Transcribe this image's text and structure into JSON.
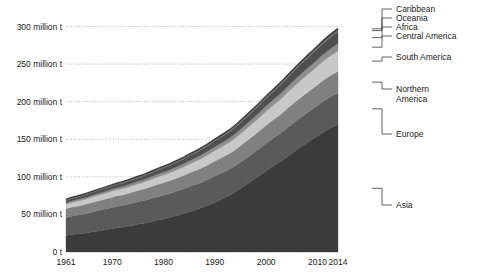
{
  "chart_data": {
    "type": "area",
    "stacked": true,
    "title": "",
    "xlabel": "",
    "ylabel": "",
    "xlim": [
      1961,
      2014
    ],
    "ylim": [
      0,
      310
    ],
    "grid": true,
    "legend_position": "right",
    "y_unit": "million t",
    "y_ticks": [
      0,
      50,
      100,
      150,
      200,
      250,
      300
    ],
    "y_tick_labels": [
      "0 t",
      "50 million t",
      "100 million t",
      "150 million t",
      "200 million t",
      "250 million t",
      "300 million t"
    ],
    "x_ticks": [
      1961,
      1970,
      1980,
      1990,
      2000,
      2010,
      2014
    ],
    "x_tick_labels": [
      "1961",
      "1970",
      "1980",
      "1990",
      "2000",
      "2010",
      "2014"
    ],
    "x": [
      1961,
      1962,
      1963,
      1964,
      1965,
      1966,
      1967,
      1968,
      1969,
      1970,
      1971,
      1972,
      1973,
      1974,
      1975,
      1976,
      1977,
      1978,
      1979,
      1980,
      1981,
      1982,
      1983,
      1984,
      1985,
      1986,
      1987,
      1988,
      1989,
      1990,
      1991,
      1992,
      1993,
      1994,
      1995,
      1996,
      1997,
      1998,
      1999,
      2000,
      2001,
      2002,
      2003,
      2004,
      2005,
      2006,
      2007,
      2008,
      2009,
      2010,
      2011,
      2012,
      2013,
      2014
    ],
    "series": [
      {
        "name": "Asia",
        "color": "#3b3b3b",
        "values": [
          22.0,
          23.0,
          23.8,
          24.6,
          25.4,
          26.5,
          27.6,
          28.7,
          29.8,
          31.0,
          32.2,
          33.0,
          34.2,
          35.4,
          36.8,
          38.0,
          39.4,
          41.0,
          42.6,
          44.0,
          45.6,
          47.4,
          49.2,
          51.2,
          53.4,
          55.6,
          57.8,
          60.4,
          63.0,
          66.0,
          69.0,
          72.4,
          76.0,
          80.0,
          84.5,
          89.0,
          93.5,
          98.0,
          103.0,
          108.0,
          112.5,
          117.0,
          121.5,
          126.5,
          131.5,
          136.5,
          141.0,
          145.5,
          150.0,
          154.5,
          159.0,
          163.0,
          166.5,
          169.5
        ]
      },
      {
        "name": "Europe",
        "color": "#5a5a5a",
        "values": [
          24.0,
          24.6,
          25.0,
          25.4,
          25.8,
          26.4,
          27.0,
          27.4,
          27.8,
          28.2,
          28.6,
          28.8,
          29.2,
          29.6,
          30.0,
          30.2,
          30.6,
          31.0,
          31.4,
          31.6,
          31.8,
          32.2,
          32.6,
          33.0,
          33.4,
          33.6,
          33.8,
          34.2,
          34.6,
          35.0,
          35.0,
          34.8,
          34.6,
          34.6,
          34.8,
          35.2,
          35.6,
          36.0,
          36.4,
          36.8,
          37.0,
          37.4,
          37.6,
          38.2,
          38.6,
          39.0,
          39.4,
          39.8,
          40.0,
          40.4,
          40.8,
          41.2,
          41.6,
          42.0
        ]
      },
      {
        "name": "Northern America",
        "color": "#808080",
        "values": [
          11.5,
          11.8,
          12.0,
          12.2,
          12.5,
          12.8,
          13.0,
          13.2,
          13.5,
          13.8,
          14.0,
          14.2,
          14.5,
          14.8,
          15.0,
          15.3,
          15.6,
          16.0,
          16.3,
          16.6,
          16.9,
          17.2,
          17.5,
          17.8,
          18.2,
          18.5,
          18.8,
          19.2,
          19.6,
          20.0,
          20.4,
          20.8,
          21.2,
          21.6,
          22.0,
          22.4,
          22.8,
          23.2,
          23.6,
          24.0,
          24.3,
          24.6,
          25.0,
          25.4,
          25.8,
          26.2,
          26.6,
          27.0,
          27.3,
          27.6,
          28.0,
          28.3,
          28.6,
          29.0
        ]
      },
      {
        "name": "South America",
        "color": "#c8c8c8",
        "values": [
          6.0,
          6.2,
          6.4,
          6.6,
          6.8,
          7.0,
          7.2,
          7.4,
          7.6,
          7.8,
          8.0,
          8.2,
          8.4,
          8.6,
          8.8,
          9.0,
          9.3,
          9.6,
          9.9,
          10.2,
          10.5,
          10.8,
          11.1,
          11.4,
          11.8,
          12.2,
          12.6,
          13.0,
          13.4,
          13.8,
          14.2,
          14.6,
          15.0,
          15.5,
          16.0,
          16.5,
          17.0,
          17.5,
          18.0,
          18.6,
          19.2,
          19.8,
          20.4,
          21.0,
          21.6,
          22.2,
          22.8,
          23.4,
          24.0,
          24.6,
          25.2,
          25.8,
          26.4,
          27.0
        ]
      },
      {
        "name": "Central America",
        "color": "#8f8f8f",
        "values": [
          2.0,
          2.1,
          2.2,
          2.3,
          2.4,
          2.5,
          2.6,
          2.7,
          2.8,
          2.9,
          3.0,
          3.1,
          3.2,
          3.3,
          3.4,
          3.5,
          3.6,
          3.7,
          3.8,
          3.9,
          4.0,
          4.1,
          4.2,
          4.3,
          4.5,
          4.6,
          4.8,
          4.9,
          5.1,
          5.2,
          5.4,
          5.5,
          5.7,
          5.9,
          6.1,
          6.3,
          6.5,
          6.7,
          6.9,
          7.1,
          7.3,
          7.5,
          7.7,
          7.9,
          8.1,
          8.3,
          8.5,
          8.7,
          8.9,
          9.1,
          9.3,
          9.5,
          9.7,
          9.9
        ]
      },
      {
        "name": "Africa",
        "color": "#4f4f4f",
        "values": [
          3.0,
          3.1,
          3.2,
          3.3,
          3.4,
          3.5,
          3.6,
          3.7,
          3.8,
          3.9,
          4.0,
          4.1,
          4.3,
          4.4,
          4.6,
          4.7,
          4.9,
          5.1,
          5.2,
          5.4,
          5.6,
          5.8,
          6.0,
          6.2,
          6.4,
          6.6,
          6.8,
          7.0,
          7.2,
          7.4,
          7.7,
          7.9,
          8.2,
          8.4,
          8.7,
          9.0,
          9.3,
          9.6,
          9.9,
          10.2,
          10.6,
          11.0,
          11.4,
          11.8,
          12.2,
          12.6,
          13.0,
          13.4,
          13.8,
          14.2,
          14.6,
          15.0,
          15.4,
          15.8
        ]
      },
      {
        "name": "Oceania",
        "color": "#6e6e6e",
        "values": [
          1.0,
          1.02,
          1.05,
          1.07,
          1.1,
          1.12,
          1.15,
          1.17,
          1.2,
          1.22,
          1.25,
          1.27,
          1.3,
          1.32,
          1.35,
          1.37,
          1.4,
          1.42,
          1.45,
          1.47,
          1.5,
          1.52,
          1.55,
          1.57,
          1.6,
          1.62,
          1.65,
          1.67,
          1.7,
          1.72,
          1.75,
          1.77,
          1.8,
          1.82,
          1.85,
          1.87,
          1.9,
          1.92,
          1.95,
          1.97,
          2.0,
          2.05,
          2.1,
          2.15,
          2.2,
          2.25,
          2.3,
          2.35,
          2.4,
          2.45,
          2.5,
          2.55,
          2.6,
          2.65
        ]
      },
      {
        "name": "Caribbean",
        "color": "#2e2e2e",
        "values": [
          1.2,
          1.22,
          1.24,
          1.26,
          1.28,
          1.3,
          1.32,
          1.34,
          1.36,
          1.38,
          1.4,
          1.42,
          1.44,
          1.46,
          1.48,
          1.5,
          1.52,
          1.54,
          1.56,
          1.58,
          1.6,
          1.62,
          1.64,
          1.66,
          1.68,
          1.7,
          1.72,
          1.74,
          1.76,
          1.78,
          1.8,
          1.82,
          1.84,
          1.86,
          1.88,
          1.9,
          1.92,
          1.94,
          1.96,
          1.98,
          2.0,
          2.02,
          2.04,
          2.06,
          2.08,
          2.1,
          2.12,
          2.14,
          2.16,
          2.18,
          2.2,
          2.22,
          2.24,
          2.26
        ]
      }
    ],
    "legend": [
      {
        "label": "Caribbean",
        "color": "#2e2e2e"
      },
      {
        "label": "Oceania",
        "color": "#6e6e6e"
      },
      {
        "label": "Africa",
        "color": "#4f4f4f"
      },
      {
        "label": "Central America",
        "color": "#8f8f8f"
      },
      {
        "label": "South America",
        "color": "#c8c8c8"
      },
      {
        "label": "Northern America",
        "color": "#808080"
      },
      {
        "label": "Europe",
        "color": "#5a5a5a"
      },
      {
        "label": "Asia",
        "color": "#3b3b3b"
      }
    ],
    "legend_labels_wrapped": [
      [
        "Caribbean"
      ],
      [
        "Oceania"
      ],
      [
        "Africa"
      ],
      [
        "Central America"
      ],
      [
        "South America"
      ],
      [
        "Northern",
        "America"
      ],
      [
        "Europe"
      ],
      [
        "Asia"
      ]
    ]
  }
}
